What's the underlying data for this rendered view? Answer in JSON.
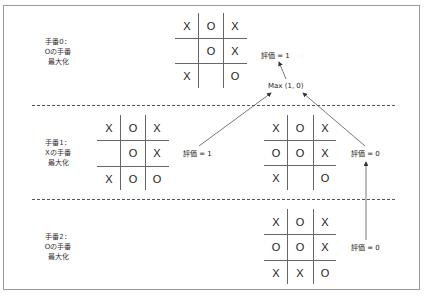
{
  "turns": [
    {
      "lines": [
        "手番0：",
        "Oの手番",
        "最大化"
      ]
    },
    {
      "lines": [
        "手番1：",
        "Xの手番",
        "最大化"
      ]
    },
    {
      "lines": [
        "手番2：",
        "Oの手番",
        "最大化"
      ]
    }
  ],
  "boards": {
    "top": [
      [
        "X",
        "O",
        "X"
      ],
      [
        "",
        "O",
        "X"
      ],
      [
        "X",
        "",
        "O"
      ]
    ],
    "middle_left": [
      [
        "X",
        "O",
        "X"
      ],
      [
        "",
        "O",
        "X"
      ],
      [
        "X",
        "O",
        "O"
      ]
    ],
    "middle_right": [
      [
        "X",
        "O",
        "X"
      ],
      [
        "O",
        "O",
        "X"
      ],
      [
        "X",
        "",
        "O"
      ]
    ],
    "bottom": [
      [
        "X",
        "O",
        "X"
      ],
      [
        "O",
        "O",
        "X"
      ],
      [
        "X",
        "X",
        "O"
      ]
    ]
  },
  "annotations": {
    "max_label": "Max (1, 0)",
    "top_eval": "評価 = 1",
    "middle_left_eval": "評価 = 1",
    "middle_right_eval": "評価 = 0",
    "bottom_eval": "評価 = 0"
  },
  "colors": {
    "frame": "#9a9a9a",
    "line": "#666666",
    "text": "#222222"
  }
}
